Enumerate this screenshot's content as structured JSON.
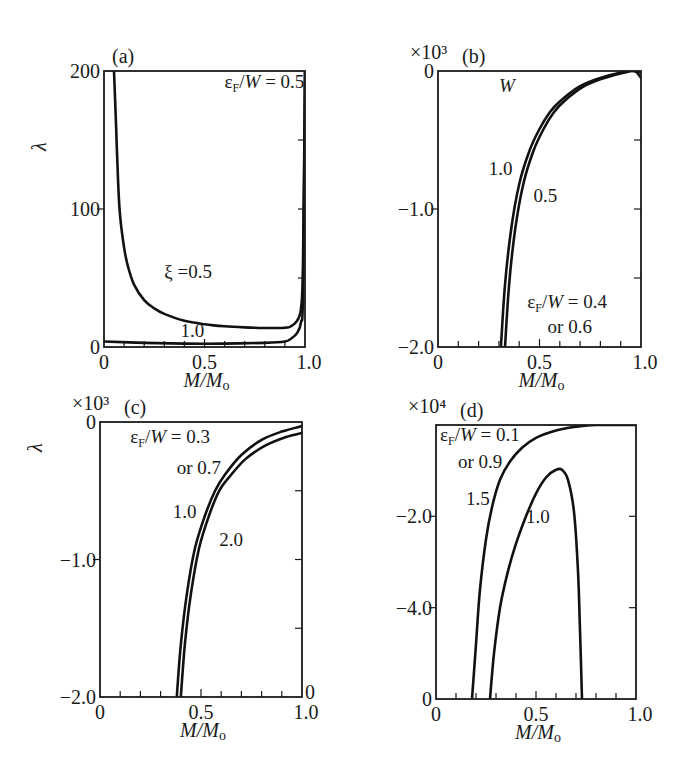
{
  "figure": {
    "x_axis_title": "M/Mₒ"
  },
  "chart_data": [
    {
      "id": "a",
      "type": "line",
      "panel_label": "(a)",
      "ylabel": "λ",
      "xlabel": "M/Mₒ",
      "multiplier": "",
      "xlim": [
        0,
        1.0
      ],
      "ylim": [
        0,
        200
      ],
      "xticks": [
        0,
        0.5,
        1.0
      ],
      "xtick_labels": [
        "0",
        "0.5",
        "1.0"
      ],
      "yticks": [
        0,
        100,
        200
      ],
      "ytick_labels": [
        "0",
        "100",
        "200"
      ],
      "grid": false,
      "annotations": [
        {
          "text": "εF/W = 0.5",
          "x": 0.6,
          "y": 188
        },
        {
          "text": "ξ =0.5",
          "x": 0.3,
          "y": 50
        },
        {
          "text": "1.0",
          "x": 0.38,
          "y": 7
        }
      ],
      "series": [
        {
          "name": "ξ=0.5",
          "x": [
            0.05,
            0.06,
            0.07,
            0.08,
            0.1,
            0.12,
            0.15,
            0.2,
            0.25,
            0.3,
            0.4,
            0.5,
            0.6,
            0.7,
            0.8,
            0.9,
            0.93,
            0.96,
            0.98,
            0.99,
            1.0
          ],
          "y": [
            200,
            160,
            120,
            95,
            72,
            58,
            45,
            34,
            28,
            24,
            19,
            16.5,
            15,
            14.2,
            13.8,
            14,
            15,
            19,
            28,
            60,
            200
          ]
        },
        {
          "name": "ξ=1.0",
          "x": [
            0,
            0.2,
            0.4,
            0.6,
            0.8,
            0.9,
            0.93,
            0.96,
            0.98,
            0.99,
            1.0
          ],
          "y": [
            4,
            3,
            2.5,
            2.5,
            3,
            4,
            6,
            10,
            18,
            40,
            200
          ]
        }
      ]
    },
    {
      "id": "b",
      "type": "line",
      "panel_label": "(b)",
      "ylabel": "",
      "xlabel": "M/Mₒ",
      "multiplier": "×10³",
      "xlim": [
        0,
        1.0
      ],
      "ylim": [
        -2.0,
        0
      ],
      "xticks": [
        0,
        0.5,
        1.0
      ],
      "xtick_labels": [
        "0",
        "0.5",
        "1.0"
      ],
      "yticks": [
        -2.0,
        -1.0,
        0
      ],
      "ytick_labels": [
        "−2.0",
        "−1.0",
        "0"
      ],
      "grid": false,
      "annotations": [
        {
          "text": "W",
          "x": 0.3,
          "y": -0.15
        },
        {
          "text": "1.0",
          "x": 0.25,
          "y": -0.75
        },
        {
          "text": "0.5",
          "x": 0.47,
          "y": -0.95
        },
        {
          "text": "εF/W = 0.4",
          "x": 0.44,
          "y": -1.72
        },
        {
          "text": "or 0.6",
          "x": 0.54,
          "y": -1.9
        }
      ],
      "series": [
        {
          "name": "W=1.0",
          "x": [
            0.31,
            0.33,
            0.36,
            0.4,
            0.45,
            0.5,
            0.55,
            0.6,
            0.7,
            0.8,
            0.9,
            0.95,
            1.0
          ],
          "y": [
            -2.0,
            -1.55,
            -1.15,
            -0.82,
            -0.58,
            -0.42,
            -0.3,
            -0.22,
            -0.11,
            -0.05,
            -0.01,
            0,
            -0.01
          ]
        },
        {
          "name": "W=0.5",
          "x": [
            0.33,
            0.35,
            0.38,
            0.42,
            0.47,
            0.52,
            0.57,
            0.62,
            0.72,
            0.82,
            0.92,
            0.97,
            1.0
          ],
          "y": [
            -2.0,
            -1.55,
            -1.15,
            -0.82,
            -0.58,
            -0.42,
            -0.3,
            -0.22,
            -0.11,
            -0.05,
            -0.01,
            0,
            -0.05
          ]
        }
      ]
    },
    {
      "id": "c",
      "type": "line",
      "panel_label": "(c)",
      "ylabel": "λ",
      "xlabel": "M/Mₒ",
      "multiplier": "×10³",
      "xlim": [
        0,
        1.0
      ],
      "ylim": [
        -2.0,
        0
      ],
      "xticks": [
        0,
        0.5,
        1.0
      ],
      "xtick_labels": [
        "0",
        "0.5",
        "1.0"
      ],
      "yticks": [
        -2.0,
        -1.0,
        0
      ],
      "ytick_labels": [
        "−2.0",
        "−1.0",
        "0"
      ],
      "grid": false,
      "extra_labels": [
        {
          "text": "0",
          "side": "right",
          "y": -2.0
        }
      ],
      "annotations": [
        {
          "text": "εF/W = 0.3",
          "x": 0.15,
          "y": -0.15
        },
        {
          "text": "or 0.7",
          "x": 0.38,
          "y": -0.38
        },
        {
          "text": "1.0",
          "x": 0.36,
          "y": -0.7
        },
        {
          "text": "2.0",
          "x": 0.59,
          "y": -0.9
        }
      ],
      "series": [
        {
          "name": "1.0",
          "x": [
            0.38,
            0.4,
            0.43,
            0.47,
            0.52,
            0.57,
            0.62,
            0.7,
            0.8,
            0.9,
            1.0
          ],
          "y": [
            -2.0,
            -1.62,
            -1.25,
            -0.92,
            -0.68,
            -0.5,
            -0.38,
            -0.24,
            -0.13,
            -0.07,
            -0.03
          ]
        },
        {
          "name": "2.0",
          "x": [
            0.4,
            0.42,
            0.45,
            0.49,
            0.54,
            0.59,
            0.64,
            0.72,
            0.82,
            0.92,
            1.0
          ],
          "y": [
            -2.0,
            -1.62,
            -1.25,
            -0.92,
            -0.68,
            -0.5,
            -0.4,
            -0.27,
            -0.17,
            -0.11,
            -0.08
          ]
        }
      ]
    },
    {
      "id": "d",
      "type": "line",
      "panel_label": "(d)",
      "ylabel": "",
      "xlabel": "M/Mₒ",
      "multiplier": "×10⁴",
      "xlim": [
        0,
        1.0
      ],
      "ylim": [
        -6.0,
        0
      ],
      "xticks": [
        0,
        0.5,
        1.0
      ],
      "xtick_labels": [
        "0",
        "0.5",
        "1.0"
      ],
      "yticks": [
        -6.0,
        -4.0,
        -2.0
      ],
      "ytick_labels": [
        "0",
        "−4.0",
        "−2.0"
      ],
      "grid": false,
      "annotations": [
        {
          "text": "εF/W = 0.1",
          "x": 0.02,
          "y": -0.35
        },
        {
          "text": "or 0.9",
          "x": 0.11,
          "y": -0.95
        },
        {
          "text": "1.5",
          "x": 0.15,
          "y": -1.75
        },
        {
          "text": "1.0",
          "x": 0.45,
          "y": -2.15
        }
      ],
      "series": [
        {
          "name": "1.5",
          "x": [
            0.18,
            0.2,
            0.22,
            0.25,
            0.28,
            0.32,
            0.37,
            0.43,
            0.5,
            0.6,
            0.7,
            0.8,
            1.0
          ],
          "y": [
            -6.0,
            -4.8,
            -3.6,
            -2.5,
            -1.8,
            -1.2,
            -0.8,
            -0.5,
            -0.28,
            -0.12,
            -0.04,
            0,
            0
          ]
        },
        {
          "name": "1.0",
          "x": [
            0.27,
            0.29,
            0.32,
            0.36,
            0.4,
            0.45,
            0.5,
            0.55,
            0.6,
            0.63,
            0.66,
            0.69,
            0.71,
            0.72,
            0.73
          ],
          "y": [
            -6.0,
            -5.0,
            -4.0,
            -3.2,
            -2.6,
            -2.0,
            -1.5,
            -1.15,
            -0.98,
            -0.98,
            -1.2,
            -1.9,
            -3.2,
            -4.5,
            -6.0
          ]
        }
      ]
    }
  ],
  "layout": {
    "panels": {
      "a": {
        "left": 104,
        "top": 71,
        "right": 305,
        "bottom": 347
      },
      "b": {
        "left": 438,
        "top": 71,
        "right": 641,
        "bottom": 347
      },
      "c": {
        "left": 100,
        "top": 422,
        "right": 302,
        "bottom": 697
      },
      "d": {
        "left": 436,
        "top": 425,
        "right": 636,
        "bottom": 699
      }
    }
  }
}
